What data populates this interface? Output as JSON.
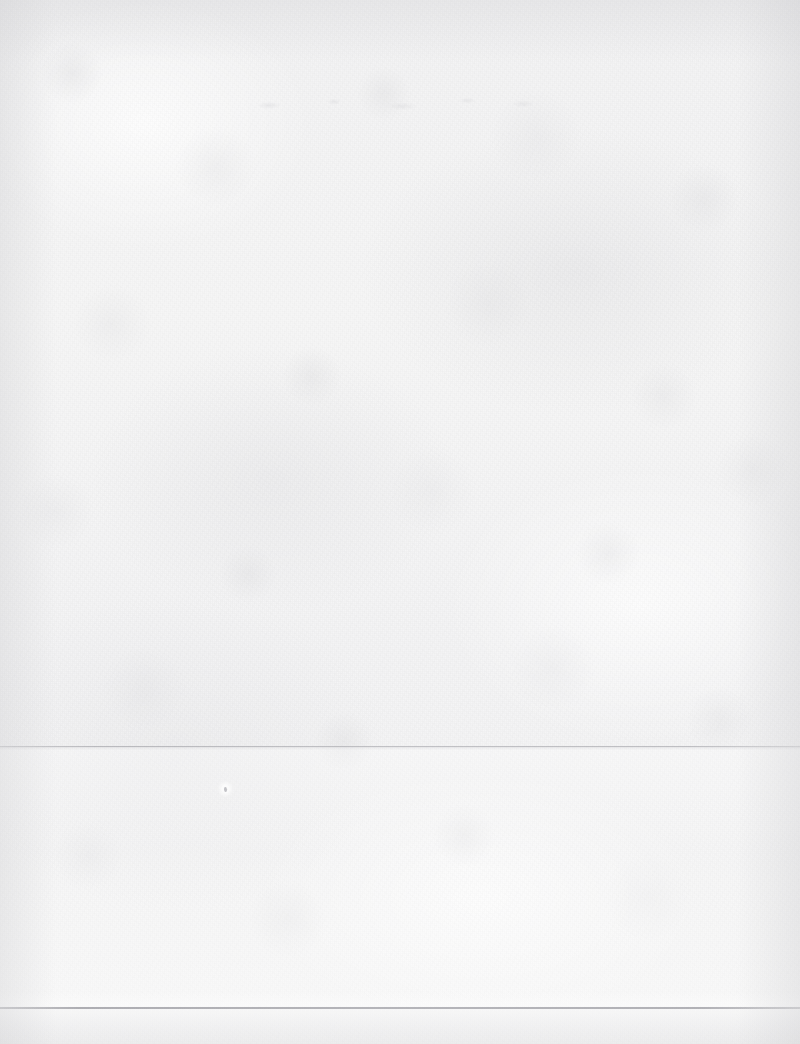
{
  "document": {
    "kind": "scanned-page",
    "title": "",
    "body_text": "",
    "is_blank": "true",
    "width_px": 800,
    "height_px": 1044
  },
  "appearance": {
    "paper_color": "#f4f4f4",
    "paper_color_light": "#f8f8f8",
    "paper_color_shadow": "#e9e9eb",
    "rule_color": "#a8a8ad",
    "speck_color": "#96969c",
    "edge_shadow_color": "#c8c8cb"
  },
  "marks": {
    "upper_rule": {
      "label": "",
      "y_px": 746,
      "spans_full_width": "true"
    },
    "lower_rule": {
      "label": "",
      "y_px": 1007,
      "spans_full_width": "true"
    },
    "ink_speck": {
      "label": "",
      "x_px": 225,
      "y_px": 789
    },
    "ghost_marks": {
      "label": "",
      "x_px": 238,
      "y_px": 90
    }
  },
  "regions": {
    "upper_area_label": "",
    "middle_band_label": "",
    "bottom_band_label": ""
  },
  "accessibility": {
    "page_description": "Blank scanned paper page"
  }
}
